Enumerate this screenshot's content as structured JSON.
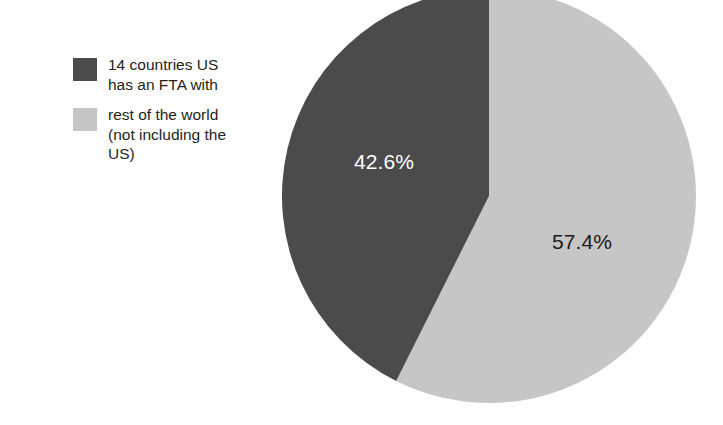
{
  "chart_data": {
    "type": "pie",
    "title": "",
    "categories": [
      "14 countries US has an FTA with",
      "rest of the world (not including the US)"
    ],
    "values": [
      42.6,
      57.4
    ],
    "value_labels": [
      "42.6%",
      "57.4%"
    ],
    "unit": "%",
    "legend_position": "left",
    "grid": false,
    "start_angle_deg": 90,
    "slices": [
      {
        "label": "14 countries US\nhas an FTA with",
        "value": 42.6,
        "value_label": "42.6%",
        "color": "#4b4b4b",
        "label_color": "#ffffff",
        "direction": "counter-clockwise"
      },
      {
        "label": "rest of the world\n(not including the\nUS)",
        "value": 57.4,
        "value_label": "57.4%",
        "color": "#c6c6c6",
        "label_color": "#1a1a1a",
        "direction": "clockwise"
      }
    ]
  },
  "legend": {
    "items": [
      {
        "label": "14 countries US\nhas an FTA with",
        "color": "#4b4b4b",
        "swatch_name": "legend-swatch-fta-countries"
      },
      {
        "label": "rest of the world\n(not including the\nUS)",
        "color": "#c6c6c6",
        "swatch_name": "legend-swatch-rest-of-world"
      }
    ]
  },
  "colors": {
    "background": "#ffffff",
    "dark_slice": "#4b4b4b",
    "light_slice": "#c6c6c6",
    "text": "#231f20"
  }
}
